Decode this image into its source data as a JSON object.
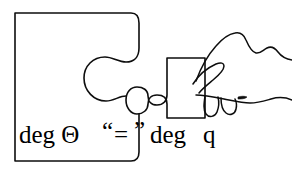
{
  "figure": {
    "background_color": "#ffffff",
    "ink_color": "#0d0d0d",
    "width": 292,
    "height": 178
  },
  "caption": {
    "full_text": "deg Θ “=” deg q",
    "left_term": "deg Θ",
    "open_quote": "“",
    "equals_sign": "=",
    "close_quote": "”",
    "right_term_prefix": "deg ",
    "right_term_symbol": "q"
  },
  "shapes": {
    "large_piece": {
      "label": "large-puzzle-piece",
      "description": "Large rectangular puzzle piece with concave socket on right edge"
    },
    "small_piece": {
      "label": "small-puzzle-piece",
      "description": "Small puzzle piece with convex tab on left edge"
    },
    "hand": {
      "label": "hand",
      "description": "Hand holding the small puzzle piece between thumb and fingers"
    }
  }
}
